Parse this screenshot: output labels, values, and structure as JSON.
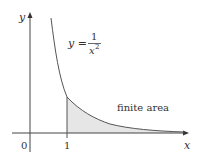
{
  "figure": {
    "y_axis_label": "y",
    "x_axis_label": "x",
    "origin_label": "0",
    "tick_label_1": "1",
    "equation": {
      "lhs": "y =",
      "numerator": "1",
      "denominator": "x",
      "exponent": "2"
    },
    "region_label": "finite area"
  },
  "colors": {
    "axis": "#444444",
    "curve": "#555555",
    "shade": "#e6e6e6",
    "text": "#333333"
  }
}
